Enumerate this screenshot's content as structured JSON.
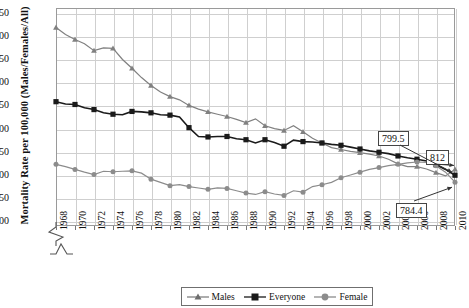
{
  "chart_data": {
    "type": "line",
    "title": "",
    "xlabel": "",
    "ylabel": "Mortality Rate per 100,000 (Males/Females/All)",
    "ylim": [
      690,
      1160
    ],
    "yticks": [
      700,
      750,
      800,
      850,
      900,
      950,
      1000,
      1050,
      1100,
      1150
    ],
    "ytick_labels": [
      "700",
      "750",
      "800",
      "850",
      "900",
      "950",
      "1,000",
      "1,050",
      "1,100",
      "1,150"
    ],
    "y_axis_break": true,
    "xlim": [
      1968,
      2010
    ],
    "xticks": [
      1968,
      1970,
      1972,
      1974,
      1976,
      1978,
      1980,
      1982,
      1984,
      1986,
      1988,
      1990,
      1992,
      1994,
      1996,
      1998,
      2000,
      2002,
      2004,
      2006,
      2008,
      2010
    ],
    "xtick_labels": [
      "1968",
      "1970",
      "1972",
      "1974",
      "1976",
      "1978",
      "1980",
      "1982",
      "1984",
      "1986",
      "1988",
      "1990",
      "1992",
      "1994",
      "1996",
      "1998",
      "2000",
      "2002",
      "2004",
      "2006",
      "2008",
      "2010"
    ],
    "x_axis_break": true,
    "grid": true,
    "legend_position": "bottom",
    "x": [
      1968,
      1969,
      1970,
      1971,
      1972,
      1973,
      1974,
      1975,
      1976,
      1977,
      1978,
      1979,
      1980,
      1981,
      1982,
      1983,
      1984,
      1985,
      1986,
      1987,
      1988,
      1989,
      1990,
      1991,
      1992,
      1993,
      1994,
      1995,
      1996,
      1997,
      1998,
      1999,
      2000,
      2001,
      2002,
      2003,
      2004,
      2005,
      2006,
      2007,
      2008,
      2009,
      2010
    ],
    "series": [
      {
        "name": "Males",
        "color": "#808080",
        "marker": "triangle",
        "values": [
          1118,
          1103,
          1092,
          1083,
          1068,
          1074,
          1073,
          1049,
          1030,
          1010,
          993,
          979,
          969,
          962,
          950,
          942,
          936,
          931,
          926,
          920,
          913,
          921,
          906,
          900,
          896,
          906,
          893,
          879,
          869,
          859,
          855,
          851,
          848,
          845,
          841,
          834,
          824,
          818,
          818,
          813,
          805,
          798,
          812
        ]
      },
      {
        "name": "Everyone",
        "color": "#1a1a1a",
        "marker": "square",
        "values": [
          958,
          953,
          952,
          945,
          941,
          934,
          931,
          930,
          937,
          936,
          934,
          930,
          929,
          925,
          902,
          883,
          882,
          883,
          883,
          878,
          876,
          869,
          876,
          870,
          862,
          875,
          872,
          871,
          869,
          866,
          864,
          860,
          856,
          852,
          849,
          846,
          841,
          837,
          834,
          830,
          822,
          812,
          799.5
        ]
      },
      {
        "name": "Female",
        "color": "#8c8c8c",
        "marker": "circle",
        "values": [
          823,
          818,
          812,
          806,
          801,
          808,
          807,
          808,
          809,
          804,
          791,
          784,
          777,
          779,
          775,
          772,
          769,
          772,
          771,
          766,
          761,
          758,
          764,
          759,
          756,
          766,
          763,
          775,
          779,
          784,
          794,
          800,
          806,
          812,
          816,
          820,
          823,
          826,
          828,
          827,
          820,
          806,
          784.4
        ]
      }
    ],
    "annotations": [
      {
        "label": "799.5",
        "series": "Everyone",
        "x": 2010,
        "value": 799.5
      },
      {
        "label": "812",
        "series": "Males",
        "x": 2010,
        "value": 812
      },
      {
        "label": "784.4",
        "series": "Female",
        "x": 2010,
        "value": 784.4
      }
    ]
  }
}
